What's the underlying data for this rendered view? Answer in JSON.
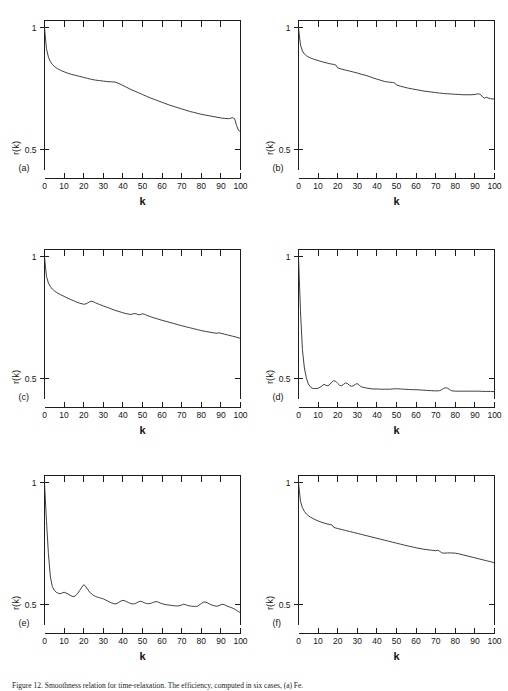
{
  "figure": {
    "caption": "Figure 12.  Smoothness relation for time-relaxation. The efficiency, computed in six cases, (a) Fe.",
    "panel_count": 6
  },
  "axes": {
    "xlabel": "k",
    "ylabel": "r(k)",
    "xticks": [
      0,
      10,
      20,
      30,
      40,
      50,
      60,
      70,
      80,
      90,
      100
    ],
    "xticklabels": [
      "0",
      "10",
      "20",
      "30",
      "40",
      "50",
      "60",
      "70",
      "80",
      "90",
      "100"
    ],
    "yticks": [
      0.5,
      1
    ],
    "yticklabels": [
      "0.5",
      "1"
    ],
    "xlim": [
      0,
      100
    ],
    "ylim": [
      0.42,
      1.03
    ]
  },
  "chart_data": [
    {
      "type": "line",
      "panel": "(a)",
      "title": "",
      "xlabel": "k",
      "ylabel": "r(k)",
      "xlim": [
        0,
        100
      ],
      "ylim": [
        0.42,
        1.03
      ],
      "grid": false,
      "legend": null,
      "x": [
        0,
        1,
        2,
        3,
        4,
        5,
        6,
        7,
        8,
        9,
        10,
        12,
        14,
        16,
        18,
        20,
        22,
        24,
        26,
        28,
        30,
        32,
        34,
        36,
        38,
        40,
        42,
        44,
        46,
        48,
        50,
        52,
        54,
        56,
        58,
        60,
        62,
        64,
        66,
        68,
        70,
        72,
        74,
        76,
        78,
        80,
        82,
        84,
        86,
        88,
        90,
        92,
        94,
        95,
        96,
        97,
        98,
        99,
        100
      ],
      "values": [
        1.0,
        0.915,
        0.88,
        0.862,
        0.85,
        0.842,
        0.836,
        0.831,
        0.827,
        0.823,
        0.82,
        0.814,
        0.809,
        0.805,
        0.801,
        0.797,
        0.793,
        0.789,
        0.786,
        0.784,
        0.782,
        0.78,
        0.779,
        0.778,
        0.772,
        0.764,
        0.756,
        0.748,
        0.741,
        0.734,
        0.727,
        0.72,
        0.713,
        0.707,
        0.701,
        0.695,
        0.689,
        0.683,
        0.678,
        0.673,
        0.668,
        0.663,
        0.658,
        0.654,
        0.65,
        0.646,
        0.643,
        0.64,
        0.637,
        0.634,
        0.631,
        0.629,
        0.628,
        0.63,
        0.632,
        0.628,
        0.6,
        0.58,
        0.575
      ]
    },
    {
      "type": "line",
      "panel": "(b)",
      "title": "",
      "xlabel": "k",
      "ylabel": "r(k)",
      "xlim": [
        0,
        100
      ],
      "ylim": [
        0.42,
        1.03
      ],
      "grid": false,
      "legend": null,
      "x": [
        0,
        1,
        2,
        3,
        4,
        5,
        6,
        8,
        10,
        12,
        14,
        16,
        18,
        19,
        20,
        22,
        24,
        26,
        28,
        30,
        32,
        34,
        36,
        38,
        40,
        42,
        44,
        46,
        48,
        49,
        50,
        52,
        54,
        56,
        58,
        60,
        62,
        64,
        66,
        68,
        70,
        72,
        74,
        76,
        78,
        80,
        82,
        84,
        86,
        88,
        90,
        91,
        92,
        93,
        94,
        95,
        96,
        97,
        98,
        100
      ],
      "values": [
        1.0,
        0.93,
        0.905,
        0.893,
        0.886,
        0.881,
        0.877,
        0.871,
        0.866,
        0.861,
        0.857,
        0.853,
        0.85,
        0.848,
        0.836,
        0.831,
        0.827,
        0.823,
        0.819,
        0.815,
        0.81,
        0.806,
        0.801,
        0.795,
        0.79,
        0.785,
        0.78,
        0.778,
        0.776,
        0.775,
        0.766,
        0.761,
        0.757,
        0.753,
        0.75,
        0.747,
        0.744,
        0.741,
        0.739,
        0.737,
        0.735,
        0.733,
        0.731,
        0.73,
        0.729,
        0.728,
        0.727,
        0.726,
        0.726,
        0.726,
        0.727,
        0.729,
        0.73,
        0.726,
        0.716,
        0.712,
        0.716,
        0.712,
        0.71,
        0.708
      ]
    },
    {
      "type": "line",
      "panel": "(c)",
      "title": "",
      "xlabel": "k",
      "ylabel": "r(k)",
      "xlim": [
        0,
        100
      ],
      "ylim": [
        0.42,
        1.03
      ],
      "grid": false,
      "legend": null,
      "x": [
        0,
        1,
        2,
        3,
        4,
        5,
        6,
        8,
        10,
        12,
        14,
        16,
        18,
        20,
        21,
        22,
        23,
        24,
        25,
        26,
        28,
        30,
        32,
        34,
        36,
        38,
        40,
        42,
        44,
        45,
        46,
        47,
        48,
        49,
        50,
        51,
        52,
        54,
        56,
        58,
        60,
        62,
        64,
        66,
        68,
        70,
        72,
        74,
        76,
        78,
        80,
        82,
        84,
        86,
        88,
        89,
        90,
        92,
        94,
        96,
        98,
        100
      ],
      "values": [
        1.0,
        0.92,
        0.893,
        0.878,
        0.868,
        0.861,
        0.855,
        0.846,
        0.838,
        0.83,
        0.823,
        0.816,
        0.81,
        0.806,
        0.807,
        0.811,
        0.816,
        0.818,
        0.816,
        0.812,
        0.805,
        0.799,
        0.793,
        0.787,
        0.781,
        0.776,
        0.771,
        0.767,
        0.764,
        0.766,
        0.768,
        0.766,
        0.763,
        0.764,
        0.767,
        0.765,
        0.761,
        0.755,
        0.75,
        0.745,
        0.74,
        0.736,
        0.731,
        0.727,
        0.722,
        0.718,
        0.714,
        0.71,
        0.706,
        0.702,
        0.698,
        0.695,
        0.692,
        0.689,
        0.687,
        0.689,
        0.687,
        0.683,
        0.679,
        0.675,
        0.671,
        0.666
      ]
    },
    {
      "type": "line",
      "panel": "(d)",
      "title": "",
      "xlabel": "k",
      "ylabel": "r(k)",
      "xlim": [
        0,
        100
      ],
      "ylim": [
        0.42,
        1.03
      ],
      "grid": false,
      "legend": null,
      "x": [
        0,
        1,
        2,
        3,
        4,
        5,
        6,
        7,
        8,
        9,
        10,
        11,
        12,
        13,
        14,
        15,
        16,
        17,
        18,
        19,
        20,
        21,
        22,
        23,
        24,
        25,
        26,
        27,
        28,
        29,
        30,
        31,
        32,
        34,
        36,
        38,
        40,
        42,
        44,
        46,
        48,
        50,
        52,
        54,
        56,
        58,
        60,
        62,
        64,
        66,
        68,
        70,
        72,
        73,
        74,
        75,
        76,
        77,
        78,
        80,
        82,
        84,
        86,
        88,
        90,
        92,
        94,
        96,
        98,
        100
      ],
      "values": [
        1.0,
        0.78,
        0.62,
        0.545,
        0.505,
        0.48,
        0.468,
        0.462,
        0.461,
        0.461,
        0.462,
        0.466,
        0.472,
        0.478,
        0.474,
        0.472,
        0.478,
        0.487,
        0.493,
        0.49,
        0.482,
        0.474,
        0.472,
        0.478,
        0.484,
        0.481,
        0.474,
        0.47,
        0.472,
        0.478,
        0.481,
        0.474,
        0.468,
        0.464,
        0.461,
        0.459,
        0.459,
        0.458,
        0.458,
        0.458,
        0.459,
        0.46,
        0.459,
        0.458,
        0.457,
        0.456,
        0.456,
        0.455,
        0.454,
        0.453,
        0.452,
        0.451,
        0.452,
        0.456,
        0.461,
        0.464,
        0.462,
        0.457,
        0.452,
        0.45,
        0.45,
        0.45,
        0.45,
        0.45,
        0.45,
        0.45,
        0.449,
        0.449,
        0.449,
        0.448
      ]
    },
    {
      "type": "line",
      "panel": "(e)",
      "title": "",
      "xlabel": "k",
      "ylabel": "r(k)",
      "xlim": [
        0,
        100
      ],
      "ylim": [
        0.42,
        1.03
      ],
      "grid": false,
      "legend": null,
      "x": [
        0,
        1,
        2,
        3,
        4,
        5,
        6,
        7,
        8,
        9,
        10,
        11,
        12,
        13,
        14,
        15,
        16,
        17,
        18,
        19,
        20,
        21,
        22,
        23,
        24,
        25,
        26,
        27,
        28,
        29,
        30,
        31,
        32,
        33,
        34,
        35,
        36,
        37,
        38,
        39,
        40,
        41,
        42,
        43,
        44,
        45,
        46,
        47,
        48,
        49,
        50,
        51,
        52,
        53,
        54,
        55,
        56,
        57,
        58,
        59,
        60,
        61,
        62,
        63,
        64,
        65,
        66,
        67,
        68,
        69,
        70,
        71,
        72,
        73,
        74,
        75,
        76,
        77,
        78,
        79,
        80,
        81,
        82,
        83,
        84,
        85,
        86,
        87,
        88,
        89,
        90,
        91,
        92,
        93,
        94,
        95,
        96,
        97,
        98,
        99,
        100
      ],
      "values": [
        1.0,
        0.845,
        0.71,
        0.615,
        0.575,
        0.56,
        0.552,
        0.548,
        0.546,
        0.549,
        0.552,
        0.549,
        0.545,
        0.54,
        0.536,
        0.534,
        0.539,
        0.548,
        0.56,
        0.572,
        0.583,
        0.576,
        0.564,
        0.553,
        0.545,
        0.539,
        0.535,
        0.532,
        0.53,
        0.527,
        0.525,
        0.521,
        0.517,
        0.513,
        0.509,
        0.506,
        0.504,
        0.506,
        0.511,
        0.516,
        0.519,
        0.517,
        0.513,
        0.509,
        0.506,
        0.504,
        0.505,
        0.509,
        0.513,
        0.515,
        0.513,
        0.509,
        0.506,
        0.505,
        0.506,
        0.509,
        0.512,
        0.514,
        0.512,
        0.508,
        0.505,
        0.503,
        0.501,
        0.5,
        0.499,
        0.498,
        0.497,
        0.496,
        0.496,
        0.497,
        0.5,
        0.503,
        0.501,
        0.498,
        0.496,
        0.495,
        0.494,
        0.494,
        0.495,
        0.5,
        0.506,
        0.511,
        0.512,
        0.509,
        0.505,
        0.501,
        0.498,
        0.496,
        0.495,
        0.497,
        0.501,
        0.503,
        0.5,
        0.496,
        0.493,
        0.49,
        0.487,
        0.483,
        0.478,
        0.473,
        0.468
      ]
    },
    {
      "type": "line",
      "panel": "(f)",
      "title": "",
      "xlabel": "k",
      "ylabel": "r(k)",
      "xlim": [
        0,
        100
      ],
      "ylim": [
        0.42,
        1.03
      ],
      "grid": false,
      "legend": null,
      "x": [
        0,
        1,
        2,
        3,
        4,
        5,
        6,
        8,
        10,
        12,
        14,
        16,
        17,
        18,
        19,
        20,
        22,
        24,
        26,
        28,
        30,
        32,
        34,
        36,
        38,
        40,
        42,
        44,
        46,
        48,
        50,
        52,
        54,
        56,
        58,
        60,
        62,
        64,
        66,
        68,
        70,
        71,
        72,
        73,
        74,
        76,
        78,
        80,
        82,
        84,
        86,
        88,
        90,
        92,
        94,
        96,
        98,
        100
      ],
      "values": [
        1.0,
        0.925,
        0.898,
        0.883,
        0.873,
        0.866,
        0.86,
        0.851,
        0.844,
        0.838,
        0.833,
        0.829,
        0.828,
        0.818,
        0.815,
        0.813,
        0.809,
        0.805,
        0.801,
        0.797,
        0.793,
        0.789,
        0.785,
        0.781,
        0.777,
        0.773,
        0.769,
        0.765,
        0.761,
        0.757,
        0.753,
        0.749,
        0.745,
        0.741,
        0.738,
        0.734,
        0.731,
        0.728,
        0.726,
        0.724,
        0.722,
        0.724,
        0.72,
        0.714,
        0.712,
        0.713,
        0.713,
        0.712,
        0.709,
        0.705,
        0.701,
        0.697,
        0.693,
        0.689,
        0.685,
        0.681,
        0.677,
        0.672
      ]
    }
  ],
  "panels": [
    {
      "letter": "(a)"
    },
    {
      "letter": "(b)"
    },
    {
      "letter": "(c)"
    },
    {
      "letter": "(d)"
    },
    {
      "letter": "(e)"
    },
    {
      "letter": "(f)"
    }
  ]
}
